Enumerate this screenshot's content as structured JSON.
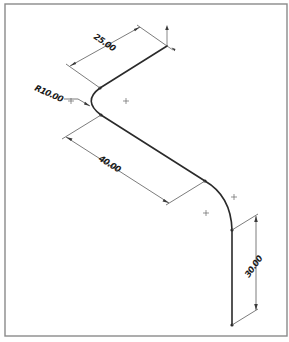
{
  "drawing": {
    "type": "isometric sheet-metal bend drawing",
    "dimensions": {
      "top_length": "25.00",
      "bend_radius": "R10.00",
      "middle_length": "40.00",
      "vertical_length": "30.00"
    },
    "colors": {
      "geometry": "#2a2a2a",
      "dimension_lines": "#5a5a5a",
      "frame": "#8a8a8a",
      "background": "#ffffff"
    }
  }
}
